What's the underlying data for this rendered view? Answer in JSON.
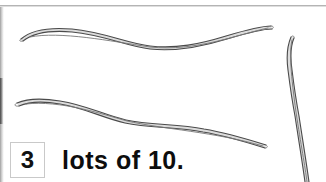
{
  "page": {
    "background_color": "#ffffff",
    "rule_color": "#b4b4b4"
  },
  "answer_line": {
    "box_value": "3",
    "text": "lots of 10.",
    "text_color": "#0d0d0d",
    "box_border_color": "#c9c9c9"
  },
  "drawing": {
    "description": "three hand-drawn wavy sticks",
    "outline_color": "#4a4a4a",
    "fill_color": "#dcdcdc",
    "sticks": [
      {
        "name": "stick-top-horizontal",
        "orientation": "horizontal"
      },
      {
        "name": "stick-middle-horizontal",
        "orientation": "horizontal"
      },
      {
        "name": "stick-right-vertical",
        "orientation": "vertical"
      }
    ]
  }
}
